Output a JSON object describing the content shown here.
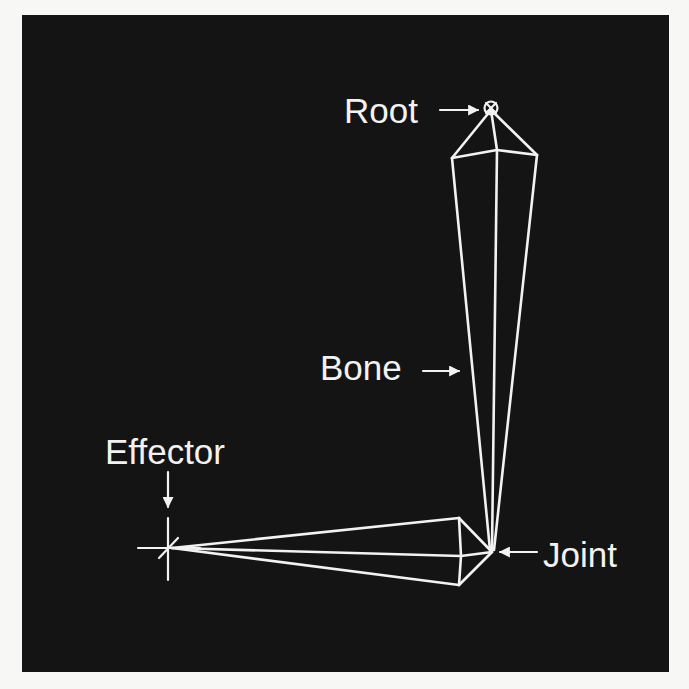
{
  "diagram": {
    "background_color": "#141414",
    "line_color": "#f2f2f2",
    "labels": {
      "root": "Root",
      "bone": "Bone",
      "effector": "Effector",
      "joint": "Joint"
    },
    "elements": [
      {
        "name": "root",
        "type": "node",
        "symbol": "circle-with-cross",
        "position": [
          491,
          108
        ]
      },
      {
        "name": "upper-bone",
        "type": "bone",
        "from": "root",
        "to": "joint",
        "direction": "vertical"
      },
      {
        "name": "joint",
        "type": "node",
        "position": [
          492,
          552
        ]
      },
      {
        "name": "lower-bone",
        "type": "bone",
        "from": "joint",
        "to": "effector",
        "direction": "horizontal"
      },
      {
        "name": "effector",
        "type": "node",
        "symbol": "crosshair",
        "position": [
          170,
          548
        ]
      }
    ],
    "annotations": [
      {
        "label": "Root",
        "arrow": "right",
        "points_to": "root"
      },
      {
        "label": "Bone",
        "arrow": "right",
        "points_to": "upper-bone"
      },
      {
        "label": "Effector",
        "arrow": "down",
        "points_to": "effector"
      },
      {
        "label": "Joint",
        "arrow": "left",
        "points_to": "joint"
      }
    ]
  }
}
